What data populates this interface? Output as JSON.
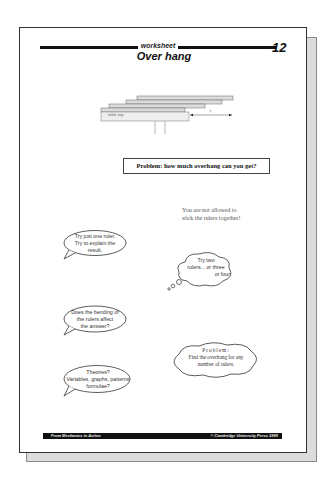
{
  "worksheet": {
    "header_label": "worksheet",
    "page_number": "12",
    "title": "Over hang"
  },
  "diagram": {
    "table_label": "table top",
    "dimension_label": "?"
  },
  "problem_box": "Problem: how much overhang can you get?",
  "note": {
    "line1": "You are not allowed to",
    "line2": "stick the rulers together!"
  },
  "bubbles": [
    {
      "type": "speech",
      "lines": [
        "Try just one ruler.",
        "Try to explain the",
        "result."
      ]
    },
    {
      "type": "thought",
      "lines": [
        "Try two",
        "rulers... or three",
        "or four"
      ]
    },
    {
      "type": "speech",
      "lines": [
        "Does the bending of",
        "the rulers affect",
        "the answer?"
      ]
    },
    {
      "type": "cloud",
      "lines": [
        "Problem:",
        "Find the overhang for any",
        "number of rulers."
      ]
    },
    {
      "type": "speech",
      "lines": [
        "Theories?",
        "Variables, graphs, patterns",
        "formulae?"
      ]
    }
  ],
  "footer": {
    "left": "From Mechanics in Action",
    "right": "© Cambridge University Press 1990"
  },
  "colors": {
    "ink": "#111111",
    "shadow": "#dcdcdc",
    "paper": "#ffffff"
  }
}
